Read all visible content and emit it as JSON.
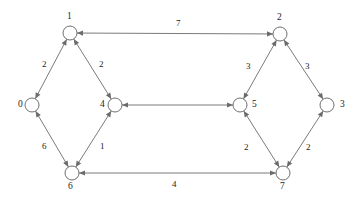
{
  "diagram": {
    "node_radius": 7,
    "colors": {
      "edge": "#7b7b7b",
      "node_stroke": "#6f6f6f",
      "node_fill": "#ffffff",
      "text": "#1c1c1c",
      "background": "#ffffff"
    },
    "nodes": [
      {
        "id": "0",
        "label": "0",
        "x": 32,
        "y": 105,
        "label_x": 18,
        "label_y": 100
      },
      {
        "id": "1",
        "label": "1",
        "x": 70,
        "y": 33,
        "label_x": 67,
        "label_y": 12
      },
      {
        "id": "2",
        "label": "2",
        "x": 280,
        "y": 34,
        "label_x": 277,
        "label_y": 13
      },
      {
        "id": "3",
        "label": "3",
        "x": 327,
        "y": 105,
        "label_x": 340,
        "label_y": 100
      },
      {
        "id": "4",
        "label": "4",
        "x": 115,
        "y": 105,
        "label_x": 100,
        "label_y": 100
      },
      {
        "id": "5",
        "label": "5",
        "x": 240,
        "y": 105,
        "label_x": 252,
        "label_y": 100
      },
      {
        "id": "6",
        "label": "6",
        "x": 72,
        "y": 173,
        "label_x": 68,
        "label_y": 182
      },
      {
        "id": "7",
        "label": "7",
        "x": 283,
        "y": 173,
        "label_x": 280,
        "label_y": 182
      }
    ],
    "edges": [
      {
        "from": "0",
        "to": "1",
        "weight": "2",
        "label_x": 42,
        "label_y": 60,
        "arrows": "both"
      },
      {
        "from": "4",
        "to": "1",
        "weight": "2",
        "label_x": 99,
        "label_y": 60,
        "arrows": "both"
      },
      {
        "from": "1",
        "to": "2",
        "weight": "7",
        "label_x": 176,
        "label_y": 19,
        "arrows": "both"
      },
      {
        "from": "2",
        "to": "5",
        "weight": "3",
        "label_x": 246,
        "label_y": 62,
        "arrows": "both"
      },
      {
        "from": "2",
        "to": "3",
        "weight": "3",
        "label_x": 305,
        "label_y": 62,
        "arrows": "both"
      },
      {
        "from": "4",
        "to": "5",
        "weight": "",
        "label_x": 177,
        "label_y": 96,
        "arrows": "both"
      },
      {
        "from": "0",
        "to": "6",
        "weight": "6",
        "label_x": 42,
        "label_y": 142,
        "arrows": "both"
      },
      {
        "from": "6",
        "to": "4",
        "weight": "1",
        "label_x": 100,
        "label_y": 142,
        "arrows": "both"
      },
      {
        "from": "5",
        "to": "7",
        "weight": "2",
        "label_x": 244,
        "label_y": 143,
        "arrows": "both"
      },
      {
        "from": "3",
        "to": "7",
        "weight": "2",
        "label_x": 306,
        "label_y": 143,
        "arrows": "both"
      },
      {
        "from": "6",
        "to": "7",
        "weight": "4",
        "label_x": 172,
        "label_y": 180,
        "arrows": "both"
      }
    ]
  }
}
